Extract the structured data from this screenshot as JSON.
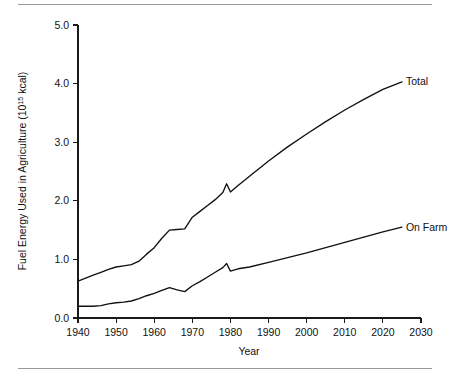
{
  "figure": {
    "width": 449,
    "height": 379,
    "background": "#ffffff",
    "rule_color": "#9a9a9a",
    "line_color": "#111111"
  },
  "chart_data": {
    "type": "line",
    "title": "",
    "xlabel": "Year",
    "ylabel": "Fuel Energy Used in Agriculture (10¹⁵ kcal)",
    "ylabel_base": "Fuel Energy Used in Agriculture (10",
    "ylabel_exponent": "15",
    "ylabel_tail": " kcal)",
    "xlim": [
      1940,
      2030
    ],
    "ylim": [
      0.0,
      5.0
    ],
    "grid": false,
    "legend_position": "right-inline",
    "xticks": [
      1940,
      1950,
      1960,
      1970,
      1980,
      1990,
      2000,
      2010,
      2020,
      2030
    ],
    "xticklabels": [
      "1940",
      "1950",
      "1960",
      "1970",
      "1980",
      "1990",
      "2000",
      "2010",
      "2020",
      "2030"
    ],
    "yticks": [
      0.0,
      1.0,
      2.0,
      3.0,
      4.0,
      5.0
    ],
    "yticklabels": [
      "0.0",
      "1.0",
      "2.0",
      "3.0",
      "4.0",
      "5.0"
    ],
    "series": [
      {
        "name": "Total",
        "label": "Total",
        "x": [
          1940,
          1942,
          1944,
          1946,
          1948,
          1950,
          1952,
          1954,
          1956,
          1958,
          1960,
          1962,
          1964,
          1966,
          1968,
          1970,
          1972,
          1974,
          1976,
          1978,
          1979,
          1980,
          1982,
          1985,
          1990,
          1995,
          2000,
          2005,
          2010,
          2015,
          2020,
          2025
        ],
        "values": [
          0.63,
          0.68,
          0.73,
          0.78,
          0.83,
          0.87,
          0.89,
          0.91,
          0.97,
          1.09,
          1.2,
          1.36,
          1.5,
          1.51,
          1.52,
          1.72,
          1.82,
          1.92,
          2.02,
          2.14,
          2.29,
          2.15,
          2.26,
          2.42,
          2.68,
          2.92,
          3.14,
          3.35,
          3.55,
          3.73,
          3.9,
          4.03
        ]
      },
      {
        "name": "On Farm",
        "label": "On Farm",
        "x": [
          1940,
          1942,
          1944,
          1946,
          1948,
          1950,
          1952,
          1954,
          1956,
          1958,
          1960,
          1962,
          1964,
          1966,
          1968,
          1970,
          1972,
          1974,
          1976,
          1978,
          1979,
          1980,
          1982,
          1985,
          1990,
          1995,
          2000,
          2005,
          2010,
          2015,
          2020,
          2025
        ],
        "values": [
          0.2,
          0.2,
          0.2,
          0.21,
          0.24,
          0.26,
          0.27,
          0.29,
          0.33,
          0.38,
          0.42,
          0.47,
          0.52,
          0.48,
          0.45,
          0.55,
          0.62,
          0.7,
          0.78,
          0.86,
          0.93,
          0.8,
          0.84,
          0.87,
          0.95,
          1.03,
          1.11,
          1.2,
          1.29,
          1.38,
          1.47,
          1.55
        ]
      }
    ],
    "annotations": [
      {
        "text": "Total",
        "at_year": 2025,
        "at_value": 4.03
      },
      {
        "text": "On Farm",
        "at_year": 2025,
        "at_value": 1.55
      }
    ]
  }
}
